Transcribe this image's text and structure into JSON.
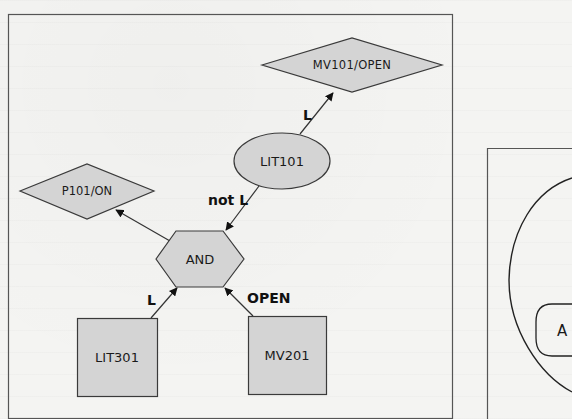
{
  "diagram": {
    "left_panel": {
      "nodes": [
        {
          "id": "mv101_open",
          "shape": "diamond",
          "label": "MV101/OPEN"
        },
        {
          "id": "lit101",
          "shape": "ellipse",
          "label": "LIT101"
        },
        {
          "id": "p101_on",
          "shape": "diamond",
          "label": "P101/ON"
        },
        {
          "id": "and",
          "shape": "hexagon",
          "label": "AND"
        },
        {
          "id": "lit301",
          "shape": "rectangle",
          "label": "LIT301"
        },
        {
          "id": "mv201",
          "shape": "rectangle",
          "label": "MV201"
        }
      ],
      "edges": [
        {
          "from": "lit101",
          "to": "mv101_open",
          "label": "L"
        },
        {
          "from": "lit101",
          "to": "and",
          "label": "not L"
        },
        {
          "from": "and",
          "to": "p101_on",
          "label": ""
        },
        {
          "from": "lit301",
          "to": "and",
          "label": "L"
        },
        {
          "from": "mv201",
          "to": "and",
          "label": "OPEN"
        }
      ]
    },
    "right_panel": {
      "partial_label": "A"
    }
  },
  "colors": {
    "node_fill": "#d4d4d4",
    "stroke": "#3a3a3a",
    "frame": "#555555",
    "background": "#f4f4f2"
  }
}
